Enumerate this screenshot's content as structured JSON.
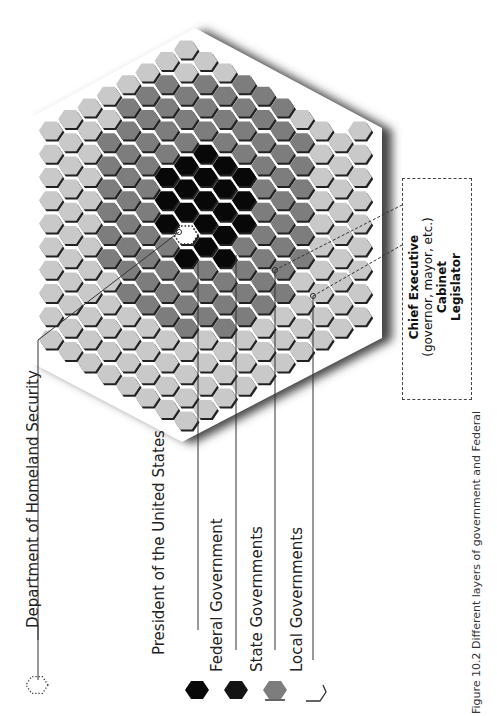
{
  "diagram": {
    "legend": [
      {
        "key": "dhs",
        "label": "Department of Homeland Security",
        "swatch": "dotted-hexagon-icon",
        "color": "#ffffff"
      },
      {
        "key": "president",
        "label": "President of the United States",
        "swatch": "black-hexagon-icon",
        "color": "#0a0a0a"
      },
      {
        "key": "federal",
        "label": "Federal Government",
        "swatch": "dark-hexagon-icon",
        "color": "#1c1c1c"
      },
      {
        "key": "state",
        "label": "State Governments",
        "swatch": "gray-hexagon-icon",
        "color": "#7a7a7a"
      },
      {
        "key": "local",
        "label": "Local Governments",
        "swatch": "light-hexagon-icon",
        "color": "#c8c8c8"
      }
    ],
    "callout_box": {
      "line1": "Chief Executive",
      "line2": "(governor, mayor, etc.)",
      "line3": "Cabinet",
      "line4": "Legislator"
    },
    "caption": "Figure 10.2  Different layers of government and Federal",
    "colors": {
      "black": "#080808",
      "state": "#7d7d7d",
      "local": "#c9c9c9",
      "shadow": "#3a3a3a",
      "frame": "#ffffff",
      "line": "#333333"
    }
  }
}
